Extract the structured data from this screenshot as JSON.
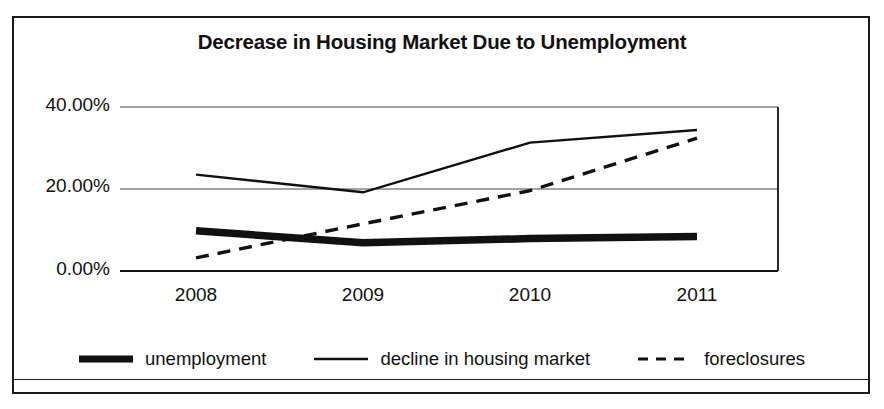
{
  "chart_data": {
    "type": "line",
    "title": "Decrease in Housing Market Due to Unemployment",
    "xlabel": "",
    "ylabel": "",
    "categories": [
      "2008",
      "2009",
      "2010",
      "2011"
    ],
    "x_tick_labels": [
      "2008",
      "2009",
      "2010",
      "2011"
    ],
    "y_tick_labels": [
      "0.00%",
      "20.00%",
      "40.00%"
    ],
    "y_tick_values": [
      0,
      20,
      40
    ],
    "ylim": [
      0,
      44
    ],
    "grid": true,
    "grid_axis": "y",
    "legend_position": "bottom",
    "series": [
      {
        "name": "unemployment",
        "style": "thick-solid",
        "color": "#111111",
        "values": [
          9.8,
          6.9,
          7.9,
          8.4
        ]
      },
      {
        "name": "decline in housing market",
        "style": "thin-solid",
        "color": "#111111",
        "values": [
          23.5,
          19.2,
          31.3,
          34.4
        ]
      },
      {
        "name": "foreclosures",
        "style": "dashed",
        "color": "#111111",
        "values": [
          3.2,
          11.5,
          19.6,
          32.4
        ]
      }
    ]
  },
  "legend": {
    "items": [
      {
        "label": "unemployment"
      },
      {
        "label": "decline in housing market"
      },
      {
        "label": "foreclosures"
      }
    ]
  },
  "colors": {
    "ink": "#111111",
    "frame": "#1a1a1a",
    "grid": "#4a4a4a",
    "background": "#ffffff"
  }
}
